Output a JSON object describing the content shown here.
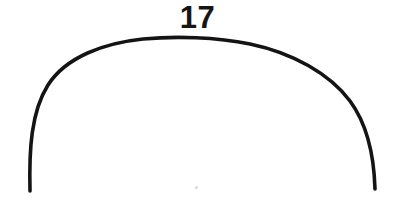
{
  "figure": {
    "background_color": "#ffffff",
    "ink_color": "#141414",
    "label": "17",
    "label_position": "above-apex",
    "canvas": {
      "width": 395,
      "height": 221
    },
    "arc": {
      "shape": "semicircular-arc",
      "stroke_color": "#141414",
      "stroke_width": 3.6,
      "apex_x": 200,
      "apex_y": 45,
      "left_end_x": 30,
      "left_end_y": 190,
      "right_end_x": 375,
      "right_end_y": 188,
      "leftmost_x": 28,
      "rightmost_x": 377,
      "span_width": 345,
      "rise_height": 145,
      "path": "M 30 191 C 29 150 31 112 48 85 C 66 57 104 43 143 39 C 175 36 216 37 250 44 C 293 53 330 74 350 101 C 367 124 374 155 375 189"
    },
    "speck": {
      "x": 195,
      "y": 186,
      "color": "#d8d8d8"
    }
  }
}
